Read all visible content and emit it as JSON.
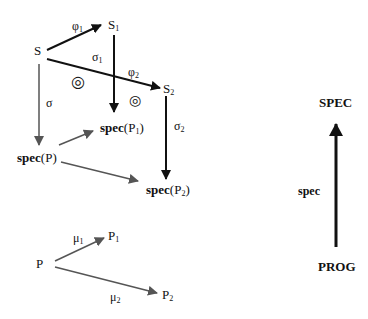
{
  "diagram": {
    "nodes": {
      "S": "S",
      "S1": {
        "base": "S",
        "sub": "1"
      },
      "S2": {
        "base": "S",
        "sub": "2"
      },
      "specP": {
        "bold": "spec",
        "rest": "(P)"
      },
      "specP1": {
        "bold": "spec",
        "rest": "(P",
        "sub": "1",
        "close": ")"
      },
      "specP2": {
        "bold": "spec",
        "rest": "(P",
        "sub": "2",
        "close": ")"
      },
      "P": "P",
      "P1": {
        "base": "P",
        "sub": "1"
      },
      "P2": {
        "base": "P",
        "sub": "2"
      },
      "SPEC": "SPEC",
      "PROG": "PROG"
    },
    "edge_labels": {
      "phi1": {
        "base": "φ",
        "sub": "1"
      },
      "phi2": {
        "base": "φ",
        "sub": "2"
      },
      "sigma": "σ",
      "sigma1": {
        "base": "σ",
        "sub": "1"
      },
      "sigma2": {
        "base": "σ",
        "sub": "2"
      },
      "mu1": {
        "base": "μ",
        "sub": "1"
      },
      "mu2": {
        "base": "μ",
        "sub": "2"
      },
      "spec": "spec"
    },
    "symbols": {
      "commutes": "◎"
    },
    "colors": {
      "black_arrow": "#111111",
      "gray_arrow": "#555555"
    }
  }
}
